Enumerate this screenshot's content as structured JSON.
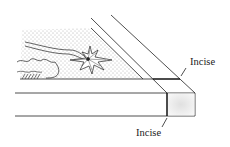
{
  "diagram": {
    "labels": [
      {
        "id": "incise-top",
        "text": "Incise"
      },
      {
        "id": "incise-bottom",
        "text": "Incise"
      }
    ],
    "colors": {
      "line": "#222222",
      "stipple": "#555555",
      "box_face": "#e8e8e8"
    }
  }
}
